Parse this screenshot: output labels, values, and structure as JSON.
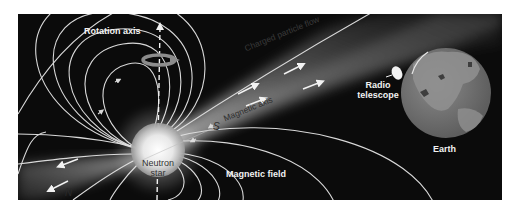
{
  "figure": {
    "background": "#0b0b0b",
    "line_color": "#d9d9d9",
    "labels": {
      "rotation_axis": "Rotation axis",
      "charged_particle_flow": "Charged particle flow",
      "magnetic_axis": "Magnetic axis",
      "south_pole": "S",
      "north_pole": "N",
      "neutron_star_line1": "Neutron",
      "neutron_star_line2": "star",
      "magnetic_field": "Magnetic field",
      "radio_telescope_line1": "Radio",
      "radio_telescope_line2": "telescope",
      "earth": "Earth"
    },
    "icons": [
      "rotation-arrow-icon",
      "radio-dish-icon",
      "earth-globe-icon",
      "neutron-star-icon"
    ]
  }
}
